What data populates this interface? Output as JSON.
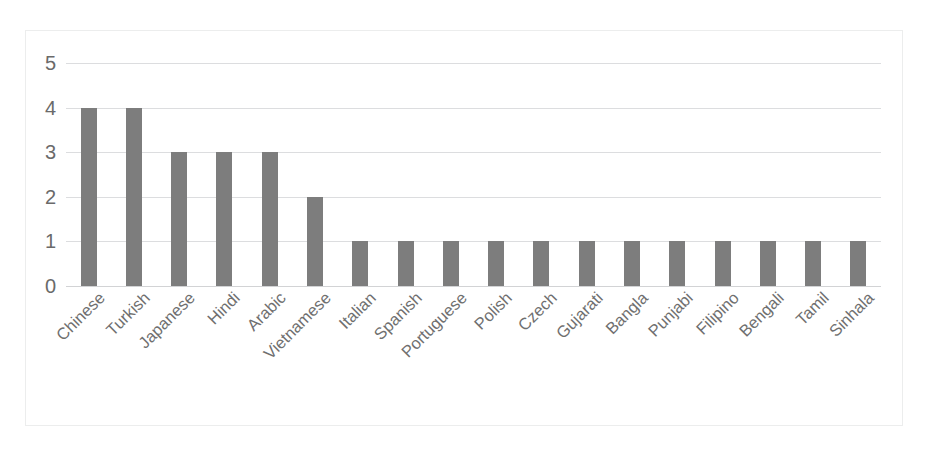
{
  "chart_data": {
    "type": "bar",
    "title": "",
    "subtitle": "",
    "xlabel": "",
    "ylabel": "",
    "ylim": [
      0,
      5
    ],
    "y_ticks": [
      0,
      1,
      2,
      3,
      4,
      5
    ],
    "grid": true,
    "legend": false,
    "legend_position": "none",
    "orientation": "vertical",
    "bar_color": "#7d7d7d",
    "gridline_color": "#dcdddf",
    "axis_label_color": "#6a6a6a",
    "categories": [
      "Chinese",
      "Turkish",
      "Japanese",
      "Hindi",
      "Arabic",
      "Vietnamese",
      "Italian",
      "Spanish",
      "Portuguese",
      "Polish",
      "Czech",
      "Gujarati",
      "Bangla",
      "Punjabi",
      "Filipino",
      "Bengali",
      "Tamil",
      "Sinhala"
    ],
    "values": [
      4,
      4,
      3,
      3,
      3,
      2,
      1,
      1,
      1,
      1,
      1,
      1,
      1,
      1,
      1,
      1,
      1,
      1
    ]
  }
}
